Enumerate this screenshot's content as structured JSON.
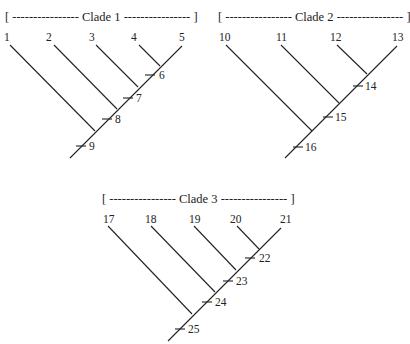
{
  "diagram": {
    "type": "cladograms",
    "clades": [
      {
        "title": "[ ---------------- Clade 1 ---------------- ]",
        "taxa": [
          "1",
          "2",
          "3",
          "4",
          "5"
        ],
        "nodes": [
          "6",
          "7",
          "8",
          "9"
        ]
      },
      {
        "title": "[ ---------------- Clade 2 ---------------- ]",
        "taxa": [
          "10",
          "11",
          "12",
          "13"
        ],
        "nodes": [
          "14",
          "15",
          "16"
        ]
      },
      {
        "title": "[ ---------------- Clade 3 ---------------- ]",
        "taxa": [
          "17",
          "18",
          "19",
          "20",
          "21"
        ],
        "nodes": [
          "22",
          "23",
          "24",
          "25"
        ]
      }
    ]
  }
}
